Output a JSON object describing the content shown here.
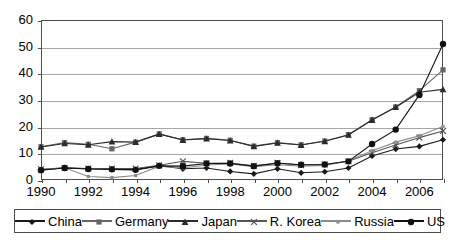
{
  "chart_data": {
    "type": "line",
    "title": "",
    "subtitle": "",
    "xlabel": "",
    "ylabel": "",
    "xlim": [
      1990,
      2007
    ],
    "ylim": [
      0,
      60
    ],
    "yticks": [
      0,
      10,
      20,
      30,
      40,
      50,
      60
    ],
    "xticks": [
      1990,
      1992,
      1994,
      1996,
      1998,
      2000,
      2002,
      2004,
      2006
    ],
    "grid": "horizontal",
    "legend_position": "bottom",
    "x": [
      1990,
      1991,
      1992,
      1993,
      1994,
      1995,
      1996,
      1997,
      1998,
      1999,
      2000,
      2001,
      2002,
      2003,
      2004,
      2005,
      2006,
      2007
    ],
    "series": [
      {
        "name": "China",
        "marker": "diamond",
        "color": "#1a1a1a",
        "values": [
          3.8,
          4.6,
          4.2,
          4.1,
          3.9,
          5.4,
          4.2,
          4.5,
          3.2,
          2.3,
          4.2,
          2.7,
          3.1,
          4.5,
          9.0,
          11.6,
          12.6,
          15.1
        ]
      },
      {
        "name": "Germany",
        "marker": "square",
        "color": "#666666",
        "values": [
          12.5,
          14.0,
          13.4,
          11.7,
          14.2,
          17.3,
          15.1,
          15.6,
          14.9,
          12.7,
          14.0,
          13.2,
          14.6,
          17.0,
          22.6,
          27.4,
          33.5,
          41.3
        ]
      },
      {
        "name": "Japan",
        "marker": "triangle",
        "color": "#2b2b2b",
        "values": [
          12.4,
          13.7,
          13.2,
          14.4,
          14.2,
          17.2,
          15.0,
          15.5,
          14.8,
          12.6,
          13.9,
          13.1,
          14.5,
          16.9,
          22.5,
          27.3,
          32.9,
          34.0
        ]
      },
      {
        "name": "R. Korea",
        "marker": "cross",
        "color": "#555555",
        "values": [
          4.0,
          4.5,
          4.3,
          4.3,
          4.3,
          5.5,
          7.0,
          6.3,
          6.4,
          5.3,
          6.4,
          5.6,
          5.8,
          7.0,
          10.2,
          13.1,
          15.9,
          18.4
        ]
      },
      {
        "name": "Russia",
        "marker": "dot-square",
        "color": "#8c8c8c",
        "values": [
          4.0,
          4.6,
          1.3,
          0.9,
          1.7,
          5.2,
          4.5,
          5.6,
          6.0,
          5.0,
          5.7,
          5.2,
          5.5,
          7.2,
          11.0,
          14.2,
          16.6,
          20.1
        ]
      },
      {
        "name": "US",
        "marker": "circle",
        "color": "#111111",
        "values": [
          3.7,
          4.5,
          4.1,
          4.0,
          3.8,
          5.3,
          5.2,
          6.2,
          6.2,
          5.2,
          6.3,
          5.7,
          5.8,
          7.0,
          13.5,
          18.9,
          31.9,
          51.0
        ]
      }
    ]
  },
  "axes": {
    "y_tick_labels": [
      "0",
      "10",
      "20",
      "30",
      "40",
      "50",
      "60"
    ],
    "x_tick_labels": [
      "1990",
      "1992",
      "1994",
      "1996",
      "1998",
      "2000",
      "2002",
      "2004",
      "2006"
    ]
  },
  "legend": {
    "items": [
      {
        "label": "China",
        "marker": "diamond",
        "color": "#1a1a1a"
      },
      {
        "label": "Germany",
        "marker": "square",
        "color": "#666666"
      },
      {
        "label": "Japan",
        "marker": "triangle",
        "color": "#2b2b2b"
      },
      {
        "label": "R. Korea",
        "marker": "cross",
        "color": "#555555"
      },
      {
        "label": "Russia",
        "marker": "dot-square",
        "color": "#8c8c8c"
      },
      {
        "label": "US",
        "marker": "circle",
        "color": "#111111"
      }
    ]
  }
}
